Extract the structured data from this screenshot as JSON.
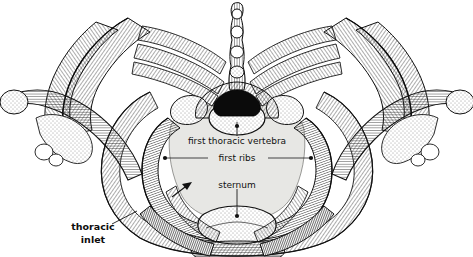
{
  "page": {
    "caption_fragment": "aperture.",
    "figure_title": "thoracic inlet viewed from above",
    "background_color": "#ffffff",
    "ink_color": "#1a1a1a",
    "inlet_fill_color": "#e7e7e4",
    "bone_fill_color": "#ffffff"
  },
  "labels": {
    "vertebra": {
      "text": "first thoracic vertebra",
      "x": 237,
      "y": 141,
      "bold": false,
      "leader_to_x": 237,
      "leader_to_y": 122
    },
    "ribs": {
      "text": "first ribs",
      "x": 237,
      "y": 158,
      "bold": false,
      "left_dot_x": 165,
      "left_dot_y": 158,
      "right_dot_x": 311,
      "right_dot_y": 158
    },
    "sternum": {
      "text": "sternum",
      "x": 237,
      "y": 185,
      "bold": false,
      "leader_to_x": 237,
      "leader_to_y": 216
    },
    "thoracic_inlet": {
      "line1": "thoracic",
      "line2": "inlet",
      "x": 93,
      "y": 229,
      "bold": true,
      "leader_to_x": 137,
      "leader_to_y": 211
    },
    "arrow": {
      "name": "inlet-direction-arrow",
      "from_x": 172,
      "from_y": 197,
      "to_x": 192,
      "to_y": 182
    }
  },
  "structures": [
    {
      "name": "first-thoracic-vertebra",
      "side": "center"
    },
    {
      "name": "vertebral-foramen",
      "side": "center"
    },
    {
      "name": "first-rib-left",
      "side": "left"
    },
    {
      "name": "first-rib-right",
      "side": "right"
    },
    {
      "name": "manubrium-sternum",
      "side": "center"
    },
    {
      "name": "clavicle-left",
      "side": "left"
    },
    {
      "name": "clavicle-right",
      "side": "right"
    },
    {
      "name": "scapula-left",
      "side": "left"
    },
    {
      "name": "scapula-right",
      "side": "right"
    },
    {
      "name": "second-rib-left",
      "side": "left"
    },
    {
      "name": "second-rib-right",
      "side": "right"
    },
    {
      "name": "third-rib-left",
      "side": "left"
    },
    {
      "name": "third-rib-right",
      "side": "right"
    },
    {
      "name": "spinous-process",
      "side": "center"
    }
  ]
}
